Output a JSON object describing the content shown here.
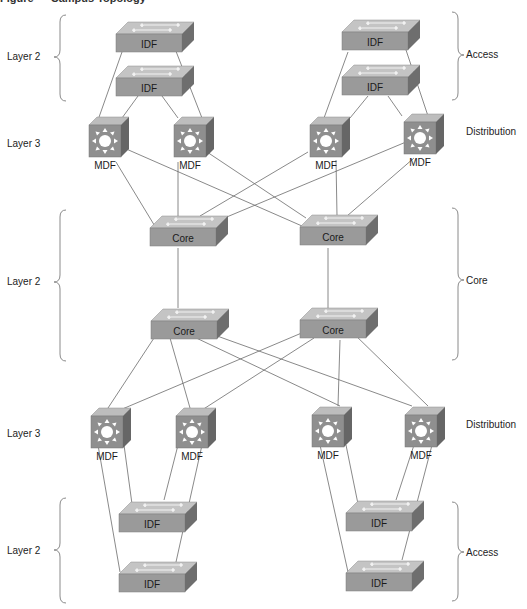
{
  "caption": "Figure — Campus Topology",
  "layer_labels": {
    "left": [
      "Layer 2",
      "Layer 3",
      "Layer 2",
      "Layer 3",
      "Layer 2"
    ],
    "right": [
      "Access",
      "Distribution",
      "Core",
      "Distribution",
      "Access"
    ]
  },
  "devices": {
    "top_idf": [
      {
        "id": "idf-tl-1",
        "label": "IDF"
      },
      {
        "id": "idf-tl-2",
        "label": "IDF"
      },
      {
        "id": "idf-tr-1",
        "label": "IDF"
      },
      {
        "id": "idf-tr-2",
        "label": "IDF"
      }
    ],
    "top_mdf": [
      {
        "id": "mdf-t-1",
        "label": "MDF"
      },
      {
        "id": "mdf-t-2",
        "label": "MDF"
      },
      {
        "id": "mdf-t-3",
        "label": "MDF"
      },
      {
        "id": "mdf-t-4",
        "label": "MDF"
      }
    ],
    "core": [
      {
        "id": "core-1",
        "label": "Core"
      },
      {
        "id": "core-2",
        "label": "Core"
      },
      {
        "id": "core-3",
        "label": "Core"
      },
      {
        "id": "core-4",
        "label": "Core"
      }
    ],
    "bottom_mdf": [
      {
        "id": "mdf-b-1",
        "label": "MDF"
      },
      {
        "id": "mdf-b-2",
        "label": "MDF"
      },
      {
        "id": "mdf-b-3",
        "label": "MDF"
      },
      {
        "id": "mdf-b-4",
        "label": "MDF"
      }
    ],
    "bottom_idf": [
      {
        "id": "idf-bl-1",
        "label": "IDF"
      },
      {
        "id": "idf-bl-2",
        "label": "IDF"
      },
      {
        "id": "idf-br-1",
        "label": "IDF"
      },
      {
        "id": "idf-br-2",
        "label": "IDF"
      }
    ]
  },
  "colors": {
    "switch_front": "#9a9a9a",
    "switch_top": "#c4c4c4",
    "switch_side": "#6e6e6e",
    "mdf_front": "#8f8f8f",
    "mdf_top": "#bdbdbd",
    "mdf_side": "#666666",
    "link": "#6b6b6b"
  }
}
